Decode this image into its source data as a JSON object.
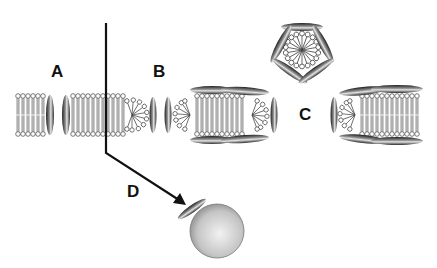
{
  "diagram": {
    "labels": {
      "a": "A",
      "b": "B",
      "c": "C",
      "d": "D"
    },
    "colors": {
      "background": "#ffffff",
      "lipid_outline": "#555555",
      "peptide_dark": "#2a2a2a",
      "peptide_light": "#d8d8d8",
      "arrow": "#111111",
      "vesicle": "#c8c8c8"
    },
    "elements": [
      {
        "id": "A",
        "kind": "single peptide inserted in bilayer"
      },
      {
        "id": "B",
        "kind": "membrane rupture / bilayer segment wrapped by peptides"
      },
      {
        "id": "C",
        "kind": "micelle-like pentagonal assembly and wrapped bilayer disc"
      },
      {
        "id": "D",
        "kind": "peptide bound to vesicle"
      }
    ]
  }
}
